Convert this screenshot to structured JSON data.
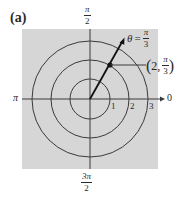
{
  "panel_label": "(a)",
  "axes": {
    "top": {
      "num": "π",
      "den": "2"
    },
    "bottom": {
      "num": "3π",
      "den": "2"
    },
    "left": "π",
    "right": "0"
  },
  "radius_ticks": [
    "1",
    "2",
    "3"
  ],
  "ray": {
    "symbol": "θ",
    "equals": "=",
    "num": "π",
    "den": "3"
  },
  "point": {
    "open": "(",
    "r": "2,",
    "num": "π",
    "den": "3",
    "close": ")"
  },
  "colors": {
    "background": "#d6d6d6",
    "line": "#3a3a3a",
    "ray": "#111111"
  }
}
